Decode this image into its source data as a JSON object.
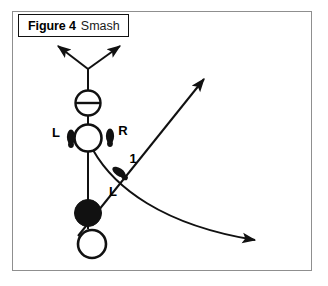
{
  "figure": {
    "caption_number": "Figure 4",
    "caption_title": "Smash",
    "frame_color": "#8f8f8f",
    "ink_color": "#111111",
    "background_color": "#ffffff"
  },
  "labels": {
    "left_foot_back": "L",
    "right_foot_back": "R",
    "step_number": "1",
    "left_foot_front": "L"
  },
  "diagram": {
    "type": "badminton-footwork-diagram",
    "elements": [
      {
        "name": "racket-head-crossed-circle",
        "shape": "circle-with-horizontal-line",
        "cx": 88,
        "cy": 102,
        "r": 13
      },
      {
        "name": "racket-head-open-circle",
        "shape": "open-circle",
        "cx": 88,
        "cy": 137,
        "r": 14
      },
      {
        "name": "shuttle-filled-circle",
        "shape": "filled-circle",
        "cx": 88,
        "cy": 212,
        "r": 14
      },
      {
        "name": "player-position-open-circle",
        "shape": "open-circle",
        "cx": 91,
        "cy": 243,
        "r": 14
      },
      {
        "name": "body-axis-line",
        "shape": "vertical-line",
        "x": 88,
        "y1": 69,
        "y2": 229
      },
      {
        "name": "left-shoulder-arrow",
        "shape": "arrow",
        "x1": 88,
        "y1": 69,
        "x2": 55,
        "y2": 45
      },
      {
        "name": "right-shoulder-arrow",
        "shape": "arrow",
        "x1": 88,
        "y1": 69,
        "x2": 120,
        "y2": 45
      },
      {
        "name": "smash-direction-arrow",
        "shape": "straight-arrow",
        "x1": 78,
        "y1": 231,
        "x2": 200,
        "y2": 78
      },
      {
        "name": "shuttle-trajectory-curve",
        "shape": "curved-arrow",
        "from": [
          93,
          148
        ],
        "to": [
          258,
          240
        ]
      },
      {
        "name": "left-foot-marker-back",
        "shape": "footprint",
        "cx": 71,
        "cy": 139
      },
      {
        "name": "right-foot-marker-back",
        "shape": "footprint",
        "cx": 110,
        "cy": 137
      },
      {
        "name": "left-foot-marker-front",
        "shape": "footprint-angled",
        "cx": 118,
        "cy": 172
      }
    ]
  }
}
